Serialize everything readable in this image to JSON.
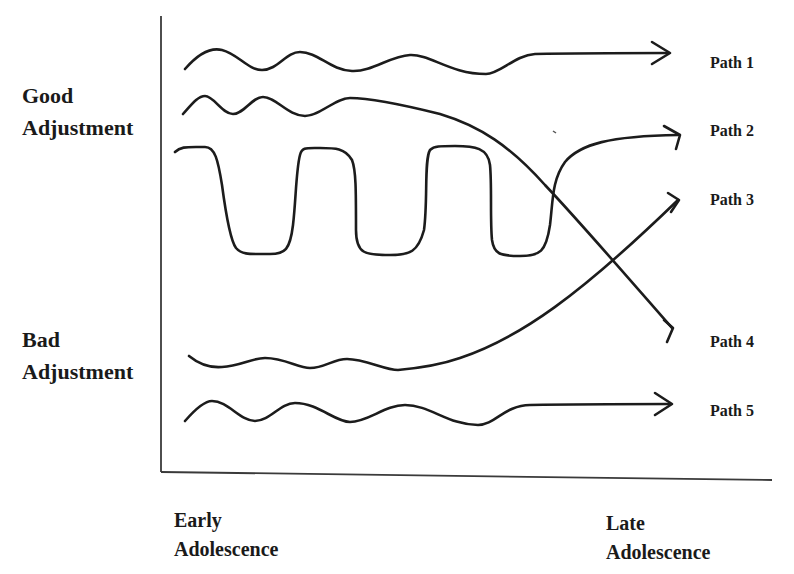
{
  "diagram": {
    "y_axis": {
      "top_label": [
        "Good",
        "Adjustment"
      ],
      "bottom_label": [
        "Bad",
        "Adjustment"
      ]
    },
    "x_axis": {
      "start_label": [
        "Early",
        "Adolescence"
      ],
      "end_label": [
        "Late",
        "Adolescence"
      ]
    },
    "paths": [
      {
        "label": "Path 1",
        "description": "fluctuates within good adjustment, stays good"
      },
      {
        "label": "Path 2",
        "description": "oscillates between good and bad, ends good"
      },
      {
        "label": "Path 3",
        "description": "starts bad, rises to good"
      },
      {
        "label": "Path 4",
        "description": "starts good, declines to bad"
      },
      {
        "label": "Path 5",
        "description": "fluctuates within bad adjustment, stays bad"
      }
    ],
    "line_color": "#1c1c1c",
    "background": "#ffffff"
  }
}
